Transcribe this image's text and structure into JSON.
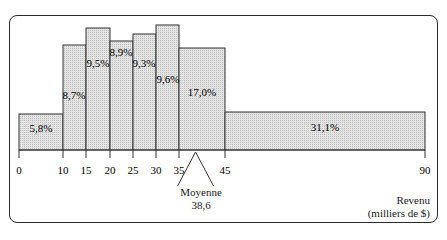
{
  "chart_data": {
    "type": "bar",
    "title": "",
    "xlabel": "Revenu (milliers de $)",
    "ylabel": "",
    "xlim": [
      0,
      90
    ],
    "x_ticks": [
      "0",
      "10",
      "15",
      "20",
      "25",
      "30",
      "35",
      "45",
      "90"
    ],
    "bins": [
      {
        "from": 0,
        "to": 10,
        "label": "5,8%",
        "value": 5.8
      },
      {
        "from": 10,
        "to": 15,
        "label": "8,7%",
        "value": 8.7
      },
      {
        "from": 15,
        "to": 20,
        "label": "9,5%",
        "value": 9.5
      },
      {
        "from": 20,
        "to": 25,
        "label": "8,9%",
        "value": 8.9
      },
      {
        "from": 25,
        "to": 30,
        "label": "9,3%",
        "value": 9.3
      },
      {
        "from": 30,
        "to": 35,
        "label": "9,6%",
        "value": 9.6
      },
      {
        "from": 35,
        "to": 45,
        "label": "17,0%",
        "value": 17.0
      },
      {
        "from": 45,
        "to": 90,
        "label": "31,1%",
        "value": 31.1
      }
    ],
    "annotations": [
      {
        "text": "Moyenne",
        "value": "38,6",
        "x": 38.6
      }
    ],
    "grid": false,
    "fill_color": "#d9d9d9",
    "edge_color": "#333333"
  },
  "labels": {
    "xlabel_line1": "Revenu",
    "xlabel_line2": "(milliers de $)",
    "mean_label": "Moyenne",
    "mean_value": "38,6"
  }
}
